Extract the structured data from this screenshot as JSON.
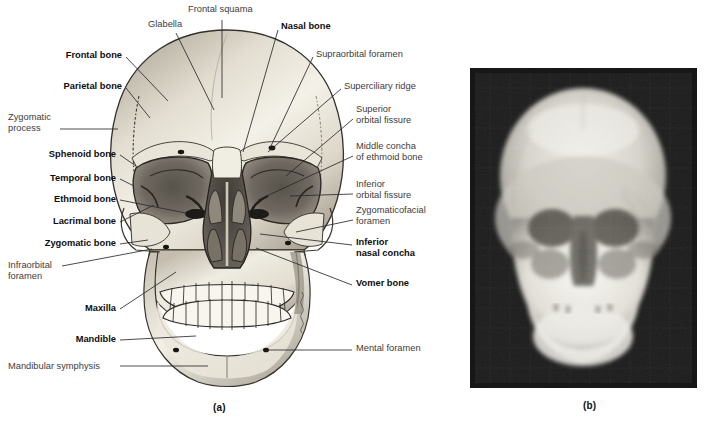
{
  "figure": {
    "panels": [
      {
        "id": "a",
        "caption": "(a)",
        "kind": "illustration"
      },
      {
        "id": "b",
        "caption": "(b)",
        "kind": "radiograph"
      }
    ]
  },
  "labels_left": [
    {
      "text": "Frontal bone",
      "bold": true,
      "x": 122,
      "y": 53,
      "lx": 126,
      "ly": 57,
      "tx": 168,
      "ty": 101
    },
    {
      "text": "Parietal bone",
      "bold": true,
      "x": 122,
      "y": 84,
      "lx": 126,
      "ly": 88,
      "tx": 150,
      "ty": 118
    },
    {
      "text": "Zygomatic\nprocess",
      "bold": false,
      "x": 8,
      "y": 109,
      "lx": 60,
      "ly": 129,
      "tx": 118,
      "ty": 129,
      "anchor": "left"
    },
    {
      "text": "Sphenoid bone",
      "bold": true,
      "x": 116,
      "y": 151,
      "lx": 120,
      "ly": 155,
      "tx": 136,
      "ty": 166
    },
    {
      "text": "Temporal bone",
      "bold": true,
      "x": 116,
      "y": 175,
      "lx": 120,
      "ly": 179,
      "tx": 134,
      "ty": 186
    },
    {
      "text": "Ethmoid bone",
      "bold": true,
      "x": 116,
      "y": 196,
      "lx": 120,
      "ly": 200,
      "tx": 186,
      "ty": 213
    },
    {
      "text": "Lacrimal bone",
      "bold": true,
      "x": 116,
      "y": 218,
      "lx": 120,
      "ly": 222,
      "tx": 154,
      "ty": 205
    },
    {
      "text": "Zygomatic bone",
      "bold": true,
      "x": 116,
      "y": 240,
      "lx": 120,
      "ly": 244,
      "tx": 148,
      "ty": 240
    },
    {
      "text": "Infraorbital\nforamen",
      "bold": false,
      "x": 8,
      "y": 262,
      "lx": 62,
      "ly": 266,
      "tx": 152,
      "ty": 249,
      "anchor": "left"
    },
    {
      "text": "Maxilla",
      "bold": true,
      "x": 116,
      "y": 305,
      "lx": 120,
      "ly": 309,
      "tx": 176,
      "ty": 272
    },
    {
      "text": "Mandible",
      "bold": true,
      "x": 116,
      "y": 336,
      "lx": 120,
      "ly": 340,
      "tx": 196,
      "ty": 336
    },
    {
      "text": "Mandibular symphysis",
      "bold": false,
      "x": 8,
      "y": 363,
      "lx": 120,
      "ly": 366,
      "tx": 208,
      "ty": 366,
      "anchor": "left"
    }
  ],
  "labels_right": [
    {
      "text": "Nasal bone",
      "bold": true,
      "x": 281,
      "y": 25,
      "lx": 278,
      "ly": 30,
      "tx": 243,
      "ty": 152
    },
    {
      "text": "Supraorbital foramen",
      "bold": false,
      "x": 316,
      "y": 52,
      "lx": 313,
      "ly": 57,
      "tx": 270,
      "ty": 148
    },
    {
      "text": "Superciliary ridge",
      "bold": false,
      "x": 344,
      "y": 84,
      "lx": 341,
      "ly": 89,
      "tx": 268,
      "ty": 152
    },
    {
      "text": "Superior\norbital fissure",
      "bold": false,
      "x": 356,
      "y": 108,
      "lx": 353,
      "ly": 119,
      "tx": 286,
      "ty": 176
    },
    {
      "text": "Middle concha\nof ethmoid bone",
      "bold": false,
      "x": 356,
      "y": 145,
      "lx": 353,
      "ly": 156,
      "tx": 258,
      "ty": 200
    },
    {
      "text": "Inferior\norbital fissure",
      "bold": false,
      "x": 356,
      "y": 183,
      "lx": 353,
      "ly": 194,
      "tx": 290,
      "ty": 196
    },
    {
      "text": "Zygomaticofacial\nforamen",
      "bold": false,
      "x": 356,
      "y": 208,
      "lx": 353,
      "ly": 220,
      "tx": 296,
      "ty": 232
    },
    {
      "text": "Inferior\nnasal concha",
      "bold": true,
      "x": 356,
      "y": 240,
      "lx": 352,
      "ly": 245,
      "tx": 260,
      "ty": 234
    },
    {
      "text": "Vomer bone",
      "bold": true,
      "x": 356,
      "y": 281,
      "lx": 352,
      "ly": 285,
      "tx": 256,
      "ty": 248
    },
    {
      "text": "Mental foramen",
      "bold": false,
      "x": 356,
      "y": 346,
      "lx": 352,
      "ly": 350,
      "tx": 266,
      "ty": 350
    }
  ],
  "labels_top": [
    {
      "text": "Glabella",
      "bold": false,
      "x": 148,
      "y": 25,
      "lx": 176,
      "ly": 33,
      "tx": 214,
      "ty": 110,
      "anchor": "left"
    },
    {
      "text": "Frontal squama",
      "bold": false,
      "x": 188,
      "y": 10,
      "lx": 222,
      "ly": 20,
      "tx": 222,
      "ty": 98,
      "anchor": "left"
    }
  ],
  "artist_signature": {
    "present": true,
    "x": 302,
    "y": 292
  },
  "colors": {
    "bone_light": "#f2efe6",
    "bone_mid": "#cfc9bb",
    "bone_shadow": "#8e8779",
    "cavity_dark": "#4a4640",
    "outline": "#33312c",
    "leader_line": "#2b2b2b",
    "label_gray": "#3c3c3c",
    "label_black": "#0d0d0d",
    "xray_background": "#1c1c1c",
    "xray_bone": "#e8e6e0",
    "page_background": "#ffffff"
  }
}
